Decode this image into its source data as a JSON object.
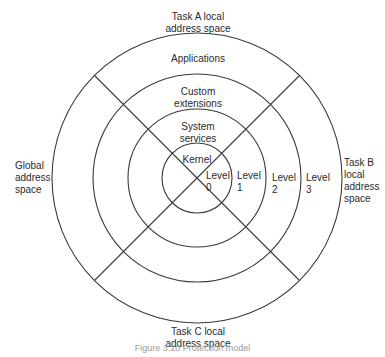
{
  "diagram": {
    "type": "concentric-rings",
    "center": [
      197,
      178
    ],
    "rings": [
      {
        "level": 0,
        "name": "Kernel",
        "radius": 35
      },
      {
        "level": 1,
        "name": "System services",
        "radius": 69
      },
      {
        "level": 2,
        "name": "Custom extensions",
        "radius": 104
      },
      {
        "level": 3,
        "name": "Applications",
        "radius": 145
      }
    ],
    "stroke_color": "#3a3a3a",
    "ring_labels": {
      "applications": "Applications",
      "custom_line1": "Custom",
      "custom_line2": "extensions",
      "system_line1": "System",
      "system_line2": "services",
      "kernel": "Kernel"
    },
    "level_labels": [
      {
        "word": "Level",
        "num": "0"
      },
      {
        "word": "Level",
        "num": "1"
      },
      {
        "word": "Level",
        "num": "2"
      },
      {
        "word": "Level",
        "num": "3"
      }
    ],
    "address_spaces": {
      "task_a_line1": "Task A local",
      "task_a_line2": "address space",
      "task_b_line1": "Task B",
      "task_b_line2": "local",
      "task_b_line3": "address",
      "task_b_line4": "space",
      "task_c_line1": "Task C local",
      "task_c_line2": "address space",
      "global_line1": "Global",
      "global_line2": "address",
      "global_line3": "space"
    },
    "caption": "Figure 3.10  Protection model"
  }
}
